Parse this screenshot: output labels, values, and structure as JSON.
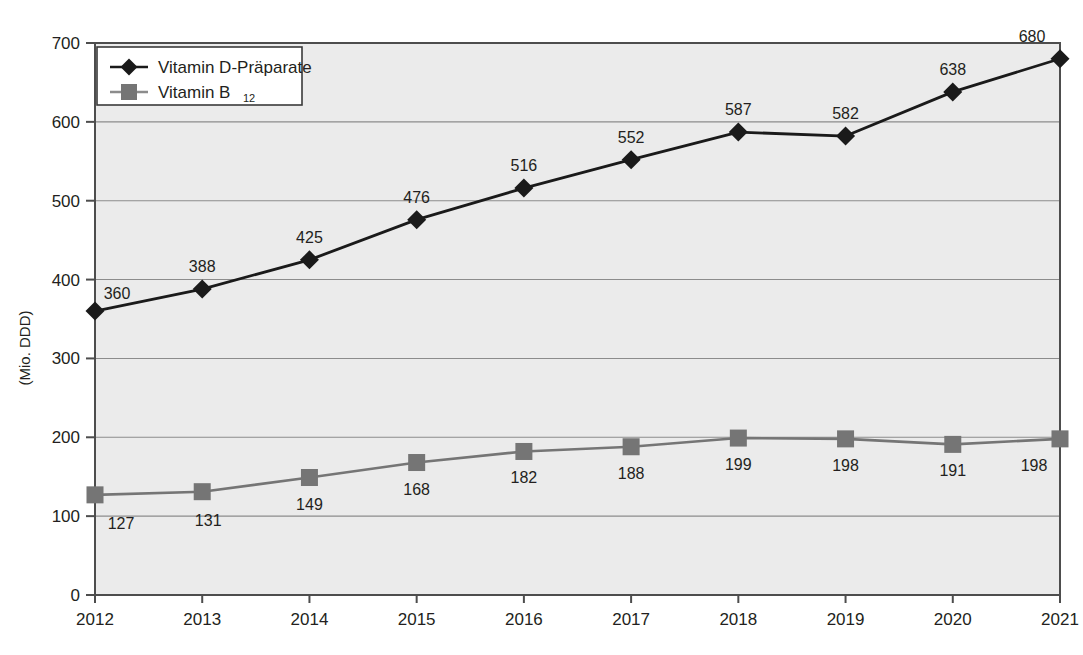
{
  "chart_data": {
    "type": "line",
    "title": "",
    "xlabel": "",
    "ylabel": "(Mio. DDD)",
    "categories": [
      "2012",
      "2013",
      "2014",
      "2015",
      "2016",
      "2017",
      "2018",
      "2019",
      "2020",
      "2021"
    ],
    "ylim": [
      0,
      700
    ],
    "yticks": [
      0,
      100,
      200,
      300,
      400,
      500,
      600,
      700
    ],
    "ytick_labels": [
      "0",
      "100",
      "200",
      "300",
      "400",
      "500",
      "600",
      "700"
    ],
    "grid": true,
    "legend_position": "top-left",
    "series": [
      {
        "name": "Vitamin D-Präparate",
        "marker": "diamond",
        "color": "#1a1a1a",
        "values": [
          360,
          388,
          425,
          476,
          516,
          552,
          587,
          582,
          638,
          680
        ],
        "labels": [
          "360",
          "388",
          "425",
          "476",
          "516",
          "552",
          "587",
          "582",
          "638",
          "680"
        ],
        "label_position": "above"
      },
      {
        "name": "Vitamin B12",
        "name_base": "Vitamin B",
        "name_sub": "12",
        "marker": "square",
        "color": "#757575",
        "values": [
          127,
          131,
          149,
          168,
          182,
          188,
          199,
          198,
          191,
          198
        ],
        "labels": [
          "127",
          "131",
          "149",
          "168",
          "182",
          "188",
          "199",
          "198",
          "191",
          "198"
        ],
        "label_position": "below"
      }
    ]
  },
  "legend": {
    "items": [
      {
        "label": "Vitamin D-Präparate",
        "sub": "",
        "marker": "diamond",
        "color": "#1a1a1a"
      },
      {
        "label": "Vitamin B",
        "sub": "12",
        "marker": "square",
        "color": "#757575"
      }
    ]
  },
  "axes": {
    "y_title": "(Mio. DDD)",
    "y_tick_labels": [
      "700",
      "600",
      "500",
      "400",
      "300",
      "200",
      "100",
      "0"
    ],
    "x_tick_labels": [
      "2012",
      "2013",
      "2014",
      "2015",
      "2016",
      "2017",
      "2018",
      "2019",
      "2020",
      "2021"
    ]
  },
  "colors": {
    "plot_background": "#ebebeb",
    "page_background": "#ffffff",
    "gridline": "#8c8c8c",
    "axis": "#4d4d4d",
    "series_d": "#1a1a1a",
    "series_b12": "#757575",
    "text": "#231f20"
  }
}
